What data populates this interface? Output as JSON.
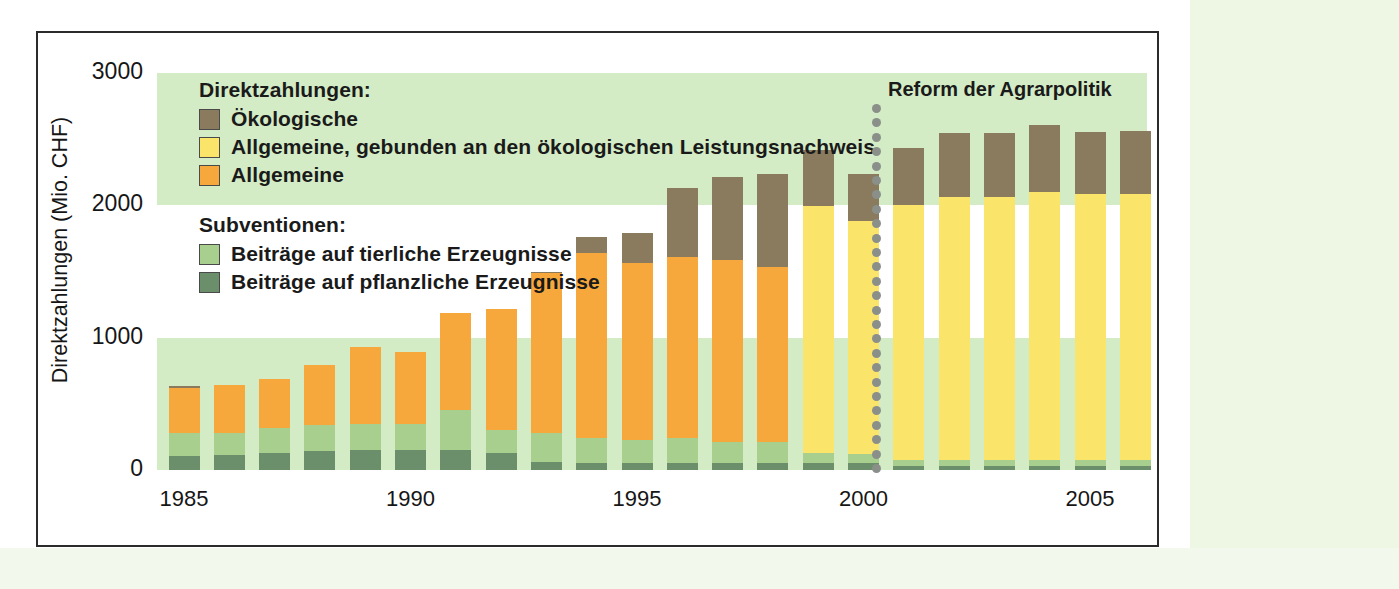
{
  "figure": {
    "reform_annotation": "Reform der Agrarpolitik"
  },
  "legend": {
    "group1_title": "Direktzahlungen:",
    "group1_items": [
      {
        "label": "Ökologische",
        "color": "#8a7a5e"
      },
      {
        "label": "Allgemeine, gebunden an den ökologischen Leistungsnachweis",
        "color": "#fbe46a"
      },
      {
        "label": "Allgemeine",
        "color": "#f7a83c"
      }
    ],
    "group2_title": "Subventionen:",
    "group2_items": [
      {
        "label": "Beiträge auf tierliche Erzeugnisse",
        "color": "#a8cf8e"
      },
      {
        "label": "Beiträge auf pflanzliche Erzeugnisse",
        "color": "#6a8f6a"
      }
    ]
  },
  "chart_data": {
    "type": "bar",
    "stacked": true,
    "title": "",
    "xlabel": "",
    "ylabel": "Direktzahlungen (Mio. CHF)",
    "ylim": [
      0,
      3000
    ],
    "yticks": [
      0,
      1000,
      2000,
      3000
    ],
    "ytick_labels": [
      "0",
      "1000",
      "2000",
      "3000"
    ],
    "xticks": [
      1985,
      1990,
      1995,
      2000,
      2005
    ],
    "xtick_labels": [
      "1985",
      "1990",
      "1995",
      "2000",
      "2005"
    ],
    "grid": false,
    "background_bands": [
      {
        "from": 0,
        "to": 1000,
        "color": "#d4ecc5"
      },
      {
        "from": 1000,
        "to": 2000,
        "color": "#ffffff"
      },
      {
        "from": 2000,
        "to": 3000,
        "color": "#d4ecc5"
      }
    ],
    "annotations": [
      {
        "text": "Reform der Agrarpolitik",
        "x": 1998.5,
        "style": "dotted-vertical-line"
      }
    ],
    "categories": [
      1985,
      1986,
      1987,
      1988,
      1989,
      1990,
      1991,
      1992,
      1993,
      1994,
      1995,
      1996,
      1997,
      1998,
      1999,
      2000,
      2001,
      2002,
      2003,
      2004,
      2005,
      2006
    ],
    "series": [
      {
        "name": "Beiträge auf pflanzliche Erzeugnisse",
        "color": "#6a8f6a",
        "values": [
          105,
          110,
          130,
          140,
          150,
          150,
          150,
          130,
          60,
          55,
          55,
          55,
          55,
          50,
          50,
          50,
          30,
          30,
          30,
          30,
          30,
          30
        ]
      },
      {
        "name": "Beiträge auf tierliche Erzeugnisse",
        "color": "#a8cf8e",
        "values": [
          175,
          170,
          190,
          200,
          200,
          200,
          305,
          175,
          220,
          185,
          175,
          185,
          155,
          165,
          75,
          70,
          45,
          45,
          45,
          45,
          45,
          45
        ]
      },
      {
        "name": "Allgemeine",
        "color": "#f7a83c",
        "values": [
          340,
          365,
          365,
          455,
          580,
          545,
          730,
          910,
          1210,
          1400,
          1335,
          1370,
          1375,
          1320,
          0,
          0,
          0,
          0,
          0,
          0,
          0,
          0
        ]
      },
      {
        "name": "Allgemeine, gebunden an den ökologischen Leistungsnachweis",
        "color": "#fbe46a",
        "values": [
          0,
          0,
          0,
          0,
          0,
          0,
          0,
          0,
          0,
          0,
          0,
          0,
          0,
          0,
          1870,
          1765,
          1930,
          1990,
          1985,
          2025,
          2010,
          2010
        ]
      },
      {
        "name": "Ökologische",
        "color": "#8a7a5e",
        "values": [
          15,
          0,
          0,
          0,
          0,
          0,
          0,
          0,
          10,
          120,
          230,
          520,
          630,
          700,
          420,
          355,
          425,
          485,
          485,
          505,
          470,
          480
        ]
      }
    ]
  }
}
